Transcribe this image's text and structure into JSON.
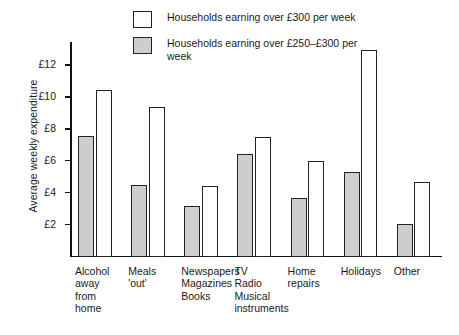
{
  "chart_data": {
    "type": "bar",
    "title": "",
    "xlabel": "",
    "ylabel": "Average weekly expenditure",
    "ylim": [
      0,
      13.5
    ],
    "yticks": [
      2,
      4,
      6,
      8,
      10,
      12
    ],
    "ytick_labels": [
      "£2",
      "£4",
      "£6",
      "£8",
      "£10",
      "£12"
    ],
    "grid": false,
    "legend_position": "top-center",
    "categories": [
      "Alcohol\naway\nfrom\nhome",
      "Meals\n'out'",
      "Newspapers\nMagazines\nBooks",
      "TV\nRadio\nMusical\ninstruments",
      "Home\nrepairs",
      "Holidays",
      "Other"
    ],
    "series": [
      {
        "name": "Households earning over £250–£300 per week",
        "style": "grey",
        "color": "#cdcdcd",
        "values": [
          7.6,
          4.5,
          3.2,
          6.45,
          3.7,
          5.35,
          2.1
        ]
      },
      {
        "name": "Households earning over £300 per week",
        "style": "white",
        "color": "#ffffff",
        "values": [
          10.5,
          9.45,
          4.45,
          7.55,
          6.05,
          13.0,
          4.7
        ]
      }
    ]
  },
  "legend": {
    "entries": [
      {
        "label": "Households earning over £300 per week",
        "swatch": "white"
      },
      {
        "label": "Households earning over £250–£300 per week",
        "swatch": "grey"
      }
    ]
  }
}
